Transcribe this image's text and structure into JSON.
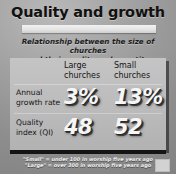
{
  "slide": {
    "title": "Quality and growth",
    "subtitle_line1": "Relationship between the size of churches",
    "subtitle_line2": "and their quality and quantity",
    "footnote_line1": "\"Small\" = under 100 in worship five years ago",
    "footnote_line2": "\"Large\" = over 300 in worship five years ago",
    "corner_mark_label": ""
  },
  "table": {
    "corner_header": "",
    "column_headers": [
      {
        "line1": "Large",
        "line2": "churches"
      },
      {
        "line1": "Small",
        "line2": "churches"
      }
    ],
    "rows": [
      {
        "label_line1": "Annual",
        "label_line2": "growth rate",
        "large": "3%",
        "small": "13%"
      },
      {
        "label_line1": "Quality",
        "label_line2": "index (QI)",
        "large": "48",
        "small": "52"
      }
    ]
  },
  "chart_data": {
    "type": "table",
    "title": "Quality and growth",
    "subtitle": "Relationship between the size of churches and their quality and quantity",
    "categories": [
      "Large churches",
      "Small churches"
    ],
    "series": [
      {
        "name": "Annual growth rate",
        "values": [
          3,
          13
        ],
        "unit": "%"
      },
      {
        "name": "Quality index (QI)",
        "values": [
          48,
          52
        ],
        "unit": ""
      }
    ],
    "xlabel": "",
    "ylabel": "",
    "grid": false,
    "legend": "none",
    "annotations": [
      "\"Small\" = under 100 in worship five years ago",
      "\"Large\" = over 300 in worship five years ago"
    ]
  },
  "colors": {
    "background_light": "#b9b9b9",
    "background_dark": "#7d7d7d",
    "panel": "#bdbdbd",
    "title_text": "#111111",
    "value_text": "#f6f6f6",
    "bottom_bar": "#141414"
  }
}
